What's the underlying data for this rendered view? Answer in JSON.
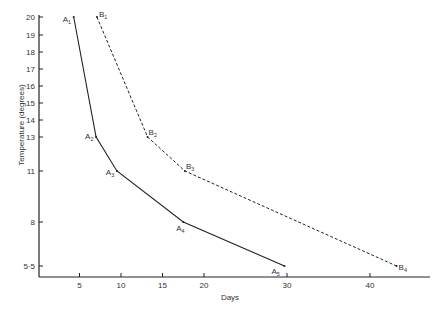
{
  "chart_data": {
    "type": "line",
    "title": "",
    "xlabel": "Days",
    "ylabel": "Temperature (degrees)",
    "x_ticks": [
      5,
      10,
      15,
      20,
      30,
      40
    ],
    "y_ticks": [
      20,
      19,
      18,
      17,
      16,
      15,
      14,
      13,
      11,
      8,
      5.5
    ],
    "y_tick_labels": [
      "20",
      "19",
      "18",
      "17",
      "16",
      "15",
      "14",
      "13",
      "11",
      "8",
      "5·5"
    ],
    "xlim": [
      0,
      45
    ],
    "grid": false,
    "legend": null,
    "series": [
      {
        "name": "A",
        "style": "solid",
        "points": [
          {
            "label": "A1",
            "x": 4.3,
            "y": 20
          },
          {
            "label": "A2",
            "x": 7.0,
            "y": 13
          },
          {
            "label": "A3",
            "x": 9.5,
            "y": 11
          },
          {
            "label": "A4",
            "x": 17.5,
            "y": 8
          },
          {
            "label": "A5",
            "x": 29.7,
            "y": 5.5
          }
        ]
      },
      {
        "name": "B",
        "style": "dashed",
        "points": [
          {
            "label": "B1",
            "x": 7.1,
            "y": 20
          },
          {
            "label": "B2",
            "x": 13.2,
            "y": 13
          },
          {
            "label": "B3",
            "x": 17.7,
            "y": 11
          },
          {
            "label": "B4",
            "x": 43.2,
            "y": 5.5
          }
        ]
      }
    ]
  },
  "labels": {
    "xlabel": "Days",
    "ylabel": "Temperature (degrees)"
  }
}
